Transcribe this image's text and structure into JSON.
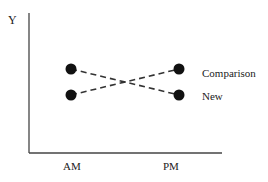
{
  "chart_data": {
    "type": "line",
    "title": "",
    "xlabel": "",
    "ylabel": "Y",
    "categories": [
      "AM",
      "PM"
    ],
    "series": [
      {
        "name": "Comparison",
        "values": [
          1,
          2
        ]
      },
      {
        "name": "New",
        "values": [
          2,
          1
        ]
      }
    ],
    "ylim": [
      0,
      3
    ],
    "grid": false,
    "legend_position": "inline-right",
    "line_style": "dashed",
    "marker": "filled-circle",
    "color": "#111111"
  },
  "labels": {
    "y_axis": "Y",
    "x_ticks": [
      "AM",
      "PM"
    ],
    "series_labels": [
      "Comparison",
      "New"
    ]
  }
}
